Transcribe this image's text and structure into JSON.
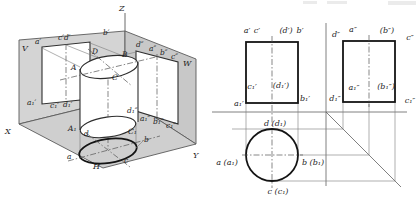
{
  "figure": {
    "type": "engineering-drawing",
    "colors": {
      "plane_v": "#d4d4d4",
      "plane_w": "#c8c8c8",
      "plane_h": "#cfcfcf",
      "line": "#2e2e2e",
      "thick_line": "#141414",
      "background": "#ffffff"
    },
    "axonometric": {
      "axis_labels": {
        "x": "X",
        "y": "Y",
        "z": "Z"
      },
      "plane_labels": {
        "v": "V",
        "w": "W",
        "h": "H"
      },
      "front_rect": {
        "a": "a′",
        "cd": "c′d′",
        "b": "b′",
        "a1": "a₁′",
        "c1": "c₁′",
        "d1": "d₁′"
      },
      "side_rect": {
        "d": "d″",
        "a": "a″",
        "b": "b″",
        "c": "c″",
        "d1": "d₁″",
        "a1": "a₁″",
        "b1": "b₁″",
        "c1": "c₁″"
      },
      "top_circle": {
        "A": "A",
        "B": "B",
        "C": "C",
        "D": "D"
      },
      "bottom_circle": {
        "A1": "A₁",
        "C1": "C₁"
      },
      "h_ellipse": {
        "a": "a",
        "b": "b",
        "c": "c",
        "d": "d"
      }
    },
    "orthographic": {
      "front_view": {
        "a": "a′",
        "c": "c′",
        "d": "(d′)",
        "b": "b′",
        "c1": "c₁′",
        "d1": "(d₁′)",
        "a1": "a₁′",
        "b1": "b₁′"
      },
      "side_view": {
        "d": "d″",
        "a": "a″",
        "b": "(b″)",
        "c": "c″",
        "a1": "a₁″",
        "b1": "(b₁″)",
        "d1": "d₁″",
        "c1": "c₁″"
      },
      "top_view": {
        "d": "d (d₁)",
        "a": "a (a₁)",
        "b": "b (b₁)",
        "c": "c (c₁)"
      }
    }
  }
}
